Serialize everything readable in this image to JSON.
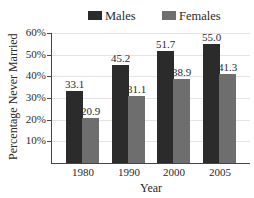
{
  "chart_data": {
    "type": "bar",
    "title": "",
    "xlabel": "Year",
    "ylabel": "Percentage Never Married",
    "categories": [
      "1980",
      "1990",
      "2000",
      "2005"
    ],
    "series": [
      {
        "name": "Males",
        "values": [
          33.1,
          45.2,
          51.7,
          55.0
        ],
        "labels": [
          "33.1",
          "45.2",
          "51.7",
          "55.0"
        ],
        "color": "#2b2b2b"
      },
      {
        "name": "Females",
        "values": [
          20.9,
          31.1,
          38.9,
          41.3
        ],
        "labels": [
          "20.9",
          "31.1",
          "38.9",
          "41.3"
        ],
        "color": "#6e6e6e"
      }
    ],
    "ylim": [
      0,
      60
    ],
    "yticks": [
      "10%",
      "20%",
      "30%",
      "40%",
      "50%",
      "60%"
    ],
    "grid": true,
    "legend_position": "top"
  },
  "legend": {
    "males": "Males",
    "females": "Females"
  },
  "colors": {
    "males": "#2b2b2b",
    "females": "#6e6e6e",
    "grid": "#e4e4e4",
    "axis": "#444444"
  }
}
